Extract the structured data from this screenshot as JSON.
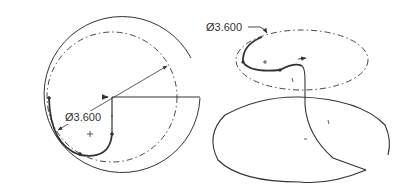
{
  "left_view": {
    "dimension_label": "Ø3.600"
  },
  "right_view": {
    "dimension_label": "Ø3.600"
  },
  "colors": {
    "line": "#333333",
    "background": "#ffffff"
  }
}
